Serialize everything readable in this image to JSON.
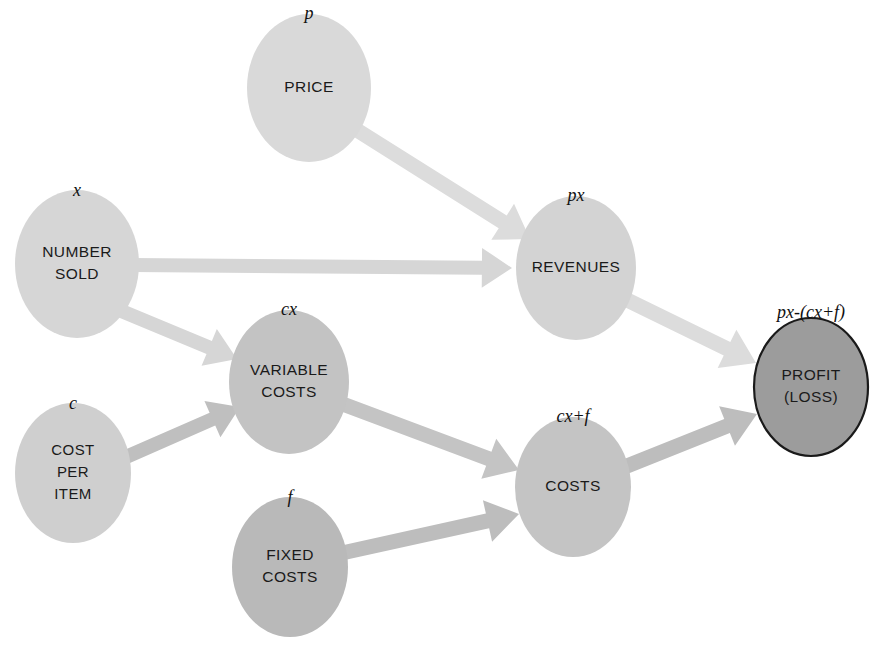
{
  "diagram": {
    "background_color": "#ffffff",
    "nodes": [
      {
        "id": "price",
        "label_lines": [
          "PRICE"
        ],
        "variable": "p",
        "cx": 309,
        "cy": 88,
        "rx": 62,
        "ry": 74,
        "fill": "#d9d9d9",
        "outlined": false,
        "var_x": 309,
        "var_y": 15
      },
      {
        "id": "number-sold",
        "label_lines": [
          "NUMBER",
          "SOLD"
        ],
        "variable": "x",
        "cx": 77,
        "cy": 264,
        "rx": 62,
        "ry": 74,
        "fill": "#d6d6d6",
        "outlined": false,
        "var_x": 77,
        "var_y": 192
      },
      {
        "id": "revenues",
        "label_lines": [
          "REVENUES"
        ],
        "variable": "px",
        "cx": 576,
        "cy": 268,
        "rx": 60,
        "ry": 72,
        "fill": "#d3d3d3",
        "outlined": false,
        "var_x": 576,
        "var_y": 197
      },
      {
        "id": "variable-costs",
        "label_lines": [
          "VARIABLE",
          "COSTS"
        ],
        "variable": "cx",
        "cx": 289,
        "cy": 382,
        "rx": 60,
        "ry": 72,
        "fill": "#c3c3c3",
        "outlined": false,
        "var_x": 289,
        "var_y": 311
      },
      {
        "id": "cost-per-item",
        "label_lines": [
          "COST",
          "PER",
          "ITEM"
        ],
        "variable": "c",
        "cx": 73,
        "cy": 473,
        "rx": 58,
        "ry": 70,
        "fill": "#cfcfcf",
        "outlined": false,
        "var_x": 73,
        "var_y": 405
      },
      {
        "id": "costs",
        "label_lines": [
          "COSTS"
        ],
        "variable": "cx+f",
        "cx": 573,
        "cy": 487,
        "rx": 58,
        "ry": 70,
        "fill": "#c4c4c4",
        "outlined": false,
        "var_x": 573,
        "var_y": 418
      },
      {
        "id": "fixed-costs",
        "label_lines": [
          "FIXED",
          "COSTS"
        ],
        "variable": "f",
        "cx": 290,
        "cy": 567,
        "rx": 58,
        "ry": 70,
        "fill": "#b9b9b9",
        "outlined": false,
        "var_x": 290,
        "var_y": 499
      },
      {
        "id": "profit-loss",
        "label_lines": [
          "PROFIT",
          "(LOSS)"
        ],
        "variable": "px-(cx+f)",
        "cx": 811,
        "cy": 387,
        "rx": 57,
        "ry": 69,
        "fill": "#9c9c9c",
        "outlined": true,
        "var_x": 811,
        "var_y": 314
      }
    ],
    "edges": [
      {
        "id": "price-to-revenues",
        "from": "price",
        "to": "revenues",
        "color": "#dcdcdc",
        "x1": 352,
        "y1": 127,
        "x2": 530,
        "y2": 239,
        "width": 15
      },
      {
        "id": "number-sold-to-revenues",
        "from": "number-sold",
        "to": "revenues",
        "color": "#d6d6d6",
        "x1": 132,
        "y1": 265,
        "x2": 512,
        "y2": 268,
        "width": 14
      },
      {
        "id": "number-sold-to-variable-costs",
        "from": "number-sold",
        "to": "variable-costs",
        "color": "#d6d6d6",
        "x1": 119,
        "y1": 310,
        "x2": 237,
        "y2": 359,
        "width": 14
      },
      {
        "id": "cost-per-item-to-variable-costs",
        "from": "cost-per-item",
        "to": "variable-costs",
        "color": "#bfbfbf",
        "x1": 126,
        "y1": 457,
        "x2": 240,
        "y2": 407,
        "width": 14
      },
      {
        "id": "variable-costs-to-costs",
        "from": "variable-costs",
        "to": "costs",
        "color": "#c4c4c4",
        "x1": 340,
        "y1": 403,
        "x2": 519,
        "y2": 470,
        "width": 15
      },
      {
        "id": "fixed-costs-to-costs",
        "from": "fixed-costs",
        "to": "costs",
        "color": "#bdbdbd",
        "x1": 342,
        "y1": 553,
        "x2": 519,
        "y2": 514,
        "width": 15
      },
      {
        "id": "revenues-to-profit",
        "from": "revenues",
        "to": "profit-loss",
        "color": "#dcdcdc",
        "x1": 621,
        "y1": 297,
        "x2": 756,
        "y2": 363,
        "width": 15
      },
      {
        "id": "costs-to-profit",
        "from": "costs",
        "to": "profit-loss",
        "color": "#bdbdbd",
        "x1": 622,
        "y1": 468,
        "x2": 757,
        "y2": 414,
        "width": 15
      }
    ]
  }
}
